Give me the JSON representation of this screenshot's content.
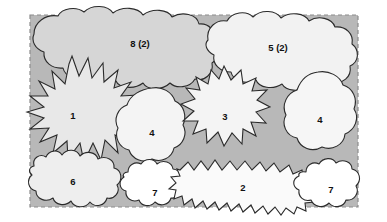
{
  "diagram": {
    "type": "region-overlap",
    "canvas": {
      "width": 387,
      "height": 222,
      "background": "#ffffff"
    },
    "boundary": {
      "name": "dashed-boundary-rectangle",
      "x": 30,
      "y": 15,
      "width": 328,
      "height": 192,
      "stroke": "#8c8c8c",
      "dash": "4,3",
      "fill": "#b8b8b8"
    },
    "palette": {
      "background_grey": "#b8b8b8",
      "shade_dark": "#d6d6d6",
      "shade_mid": "#e2e2e2",
      "shade_light": "#efefef",
      "shade_white": "#ffffff",
      "outline": "#2b2b2b",
      "label_color": "#111111"
    },
    "regions": [
      {
        "id": "r8",
        "label": "8 (2)",
        "shape": "cloud",
        "fill": "#d6d6d6",
        "cx": 140,
        "cy": 44
      },
      {
        "id": "r5",
        "label": "5 (2)",
        "shape": "cloud",
        "fill": "#f2f2f2",
        "cx": 278,
        "cy": 48
      },
      {
        "id": "r1",
        "label": "1",
        "shape": "starburst",
        "fill": "#e8e8e8",
        "cx": 73,
        "cy": 116
      },
      {
        "id": "r4a",
        "label": "4",
        "shape": "blob",
        "fill": "#f4f4f4",
        "cx": 152,
        "cy": 133
      },
      {
        "id": "r3",
        "label": "3",
        "shape": "starburst",
        "fill": "#f4f4f4",
        "cx": 225,
        "cy": 117
      },
      {
        "id": "r4b",
        "label": "4",
        "shape": "blob",
        "fill": "#f6f6f6",
        "cx": 320,
        "cy": 120
      },
      {
        "id": "r6",
        "label": "6",
        "shape": "bumpy-blob",
        "fill": "#eeeeee",
        "cx": 73,
        "cy": 182
      },
      {
        "id": "r7a",
        "label": "7",
        "shape": "bumpy-blob",
        "fill": "#ffffff",
        "cx": 155,
        "cy": 193
      },
      {
        "id": "r2",
        "label": "2",
        "shape": "jagged",
        "fill": "#fafafa",
        "cx": 243,
        "cy": 188
      },
      {
        "id": "r7b",
        "label": "7",
        "shape": "blob",
        "fill": "#ffffff",
        "cx": 331,
        "cy": 190
      }
    ]
  }
}
